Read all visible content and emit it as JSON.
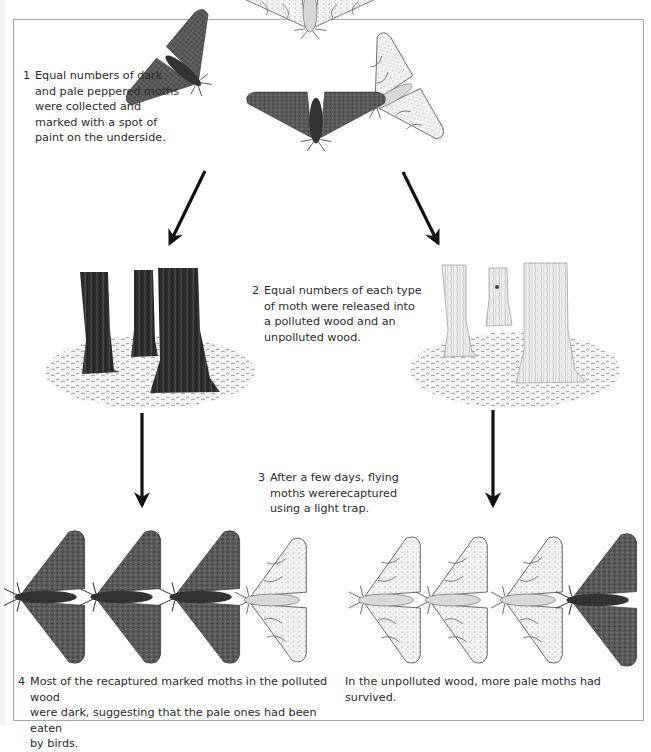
{
  "diagram": {
    "steps": [
      {
        "number": "1",
        "text_lines": [
          "Equal numbers of dark",
          "and pale peppered moths",
          "were collected and",
          "marked with a spot of",
          "paint on the underside."
        ]
      },
      {
        "number": "2",
        "text_lines": [
          "Equal numbers of each type",
          "of moth were released into",
          "a polluted wood and an",
          "unpolluted wood."
        ]
      },
      {
        "number": "3",
        "text_lines": [
          "After a few days, flying",
          "moths wererecaptured",
          "using a light trap."
        ]
      },
      {
        "number": "4",
        "text_lines": [
          "Most of the recaptured marked moths in the polluted wood",
          "were dark, suggesting that the pale ones had been eaten",
          "by birds."
        ]
      }
    ],
    "unpolluted_result": "In the unpolluted wood, more pale moths had survived.",
    "top_moths": [
      {
        "form": "dark",
        "pose": "angled-left"
      },
      {
        "form": "pale",
        "pose": "spread-top"
      },
      {
        "form": "pale",
        "pose": "angled-right"
      },
      {
        "form": "dark",
        "pose": "spread-center"
      }
    ],
    "woods": [
      {
        "type": "polluted",
        "trunk_color": "dark",
        "trees": 3
      },
      {
        "type": "unpolluted",
        "trunk_color": "pale",
        "trees": 3
      }
    ],
    "recaptured_polluted": [
      "dark",
      "dark",
      "dark",
      "pale"
    ],
    "recaptured_unpolluted": [
      "pale",
      "pale",
      "pale",
      "dark"
    ],
    "colors": {
      "dark_moth": "#4a4a4a",
      "dark_moth_body": "#333333",
      "pale_moth": "#efefef",
      "pale_moth_stroke": "#5a5a5a",
      "dark_trunk": "#2e2e2e",
      "pale_trunk": "#ececec",
      "arrow": "#111111",
      "frame": "#a9a9a9"
    }
  }
}
